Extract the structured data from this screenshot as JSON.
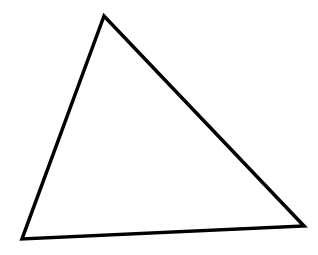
{
  "diagram": {
    "shape": "triangle",
    "stroke_color": "#000000",
    "fill_color": "none",
    "stroke_width": 3.5,
    "vertices": [
      {
        "x": 104,
        "y": 16
      },
      {
        "x": 22,
        "y": 239
      },
      {
        "x": 304,
        "y": 226
      }
    ],
    "points": "104,16 22,239 304,226"
  }
}
